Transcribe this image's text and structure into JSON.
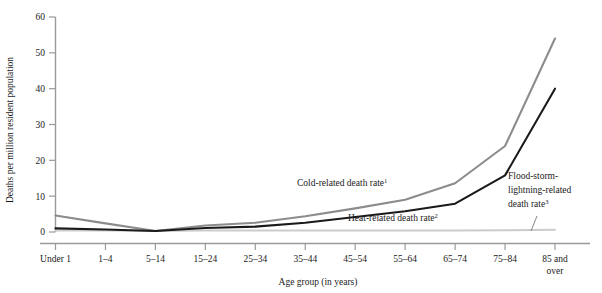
{
  "chart_data": {
    "type": "line",
    "title": "",
    "xlabel": "Age group (in years)",
    "ylabel": "Deaths per million resident population",
    "ylim": [
      0,
      60
    ],
    "yticks": [
      0,
      10,
      20,
      30,
      40,
      50,
      60
    ],
    "grid": false,
    "legend_position": "inline-annotations",
    "categories": [
      "Under 1",
      "1–4",
      "5–14",
      "15–24",
      "25–34",
      "35–44",
      "45–54",
      "55–64",
      "65–74",
      "75–84",
      "85 and over"
    ],
    "category_lines": [
      [
        "Under 1"
      ],
      [
        "1–4"
      ],
      [
        "5–14"
      ],
      [
        "15–24"
      ],
      [
        "25–34"
      ],
      [
        "35–44"
      ],
      [
        "45–54"
      ],
      [
        "55–64"
      ],
      [
        "65–74"
      ],
      [
        "75–84"
      ],
      [
        "85 and",
        "over"
      ]
    ],
    "series": [
      {
        "name": "Cold-related death rate",
        "footnote_marker": "1",
        "color": "#8c8c8c",
        "values": [
          4.6,
          2.4,
          0.3,
          1.8,
          2.6,
          4.4,
          6.6,
          9.0,
          13.6,
          24.0,
          54.0
        ]
      },
      {
        "name": "Heat-related death rate",
        "footnote_marker": "2",
        "color": "#1a1a1a",
        "values": [
          1.0,
          0.7,
          0.3,
          1.1,
          1.5,
          2.6,
          4.2,
          5.8,
          7.9,
          15.8,
          40.0
        ]
      },
      {
        "name": "Flood-storm-lightning-related death rate",
        "footnote_marker": "3",
        "color": "#cccccc",
        "values": [
          0.4,
          0.4,
          0.3,
          0.4,
          0.4,
          0.4,
          0.4,
          0.4,
          0.4,
          0.5,
          0.6
        ]
      }
    ],
    "annotations": [
      {
        "id": "cold-annotation",
        "text": "Cold-related death rate",
        "marker": "1",
        "x": 297,
        "y": 186
      },
      {
        "id": "heat-annotation",
        "text": "Heat-related death rate",
        "marker": "2",
        "x": 348,
        "y": 221
      },
      {
        "id": "flood-annotation",
        "line1": "Flood-storm-",
        "line2": "lightning-related",
        "line3": "death rate",
        "marker": "3",
        "x": 508,
        "y": 179
      }
    ],
    "axis_colors": {
      "axis_line": "#999999",
      "tick": "#555555"
    }
  }
}
